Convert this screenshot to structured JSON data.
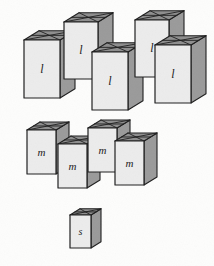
{
  "figure": {
    "background_color": "#fdfdfc",
    "width": 214,
    "height": 266
  },
  "style": {
    "front_face_color": "#ececec",
    "side_face_color": "#9a9a9a",
    "top_face_color": "#8e8e8e",
    "top_flap_color": "#a6a6a6",
    "outline_color": "#1e1e1e",
    "label_color": "#1a1a1a"
  },
  "groups": [
    {
      "id": "large",
      "label": "l",
      "count": 5,
      "size_name": "large"
    },
    {
      "id": "medium",
      "label": "m",
      "count": 4,
      "size_name": "medium"
    },
    {
      "id": "small",
      "label": "s",
      "count": 1,
      "size_name": "small"
    }
  ],
  "boxes": [
    {
      "id": "large-1",
      "label": "l",
      "x": 24,
      "y": 40,
      "w": 36,
      "h": 58,
      "d": 15,
      "font_size": 12
    },
    {
      "id": "large-2",
      "label": "l",
      "x": 64,
      "y": 22,
      "w": 34,
      "h": 57,
      "d": 15,
      "font_size": 12
    },
    {
      "id": "large-3",
      "label": "l",
      "x": 92,
      "y": 52,
      "w": 36,
      "h": 58,
      "d": 15,
      "font_size": 12
    },
    {
      "id": "large-4",
      "label": "l",
      "x": 135,
      "y": 20,
      "w": 34,
      "h": 57,
      "d": 15,
      "font_size": 12
    },
    {
      "id": "large-5",
      "label": "l",
      "x": 155,
      "y": 45,
      "w": 36,
      "h": 58,
      "d": 15,
      "font_size": 12
    },
    {
      "id": "medium-1",
      "label": "m",
      "x": 27,
      "y": 130,
      "w": 29,
      "h": 44,
      "d": 13,
      "font_size": 11
    },
    {
      "id": "medium-2",
      "label": "m",
      "x": 58,
      "y": 144,
      "w": 29,
      "h": 44,
      "d": 13,
      "font_size": 11
    },
    {
      "id": "medium-3",
      "label": "m",
      "x": 88,
      "y": 128,
      "w": 29,
      "h": 44,
      "d": 13,
      "font_size": 11
    },
    {
      "id": "medium-4",
      "label": "m",
      "x": 115,
      "y": 141,
      "w": 29,
      "h": 44,
      "d": 13,
      "font_size": 11
    },
    {
      "id": "small-1",
      "label": "s",
      "x": 70,
      "y": 215,
      "w": 21,
      "h": 33,
      "d": 10,
      "font_size": 10
    }
  ]
}
